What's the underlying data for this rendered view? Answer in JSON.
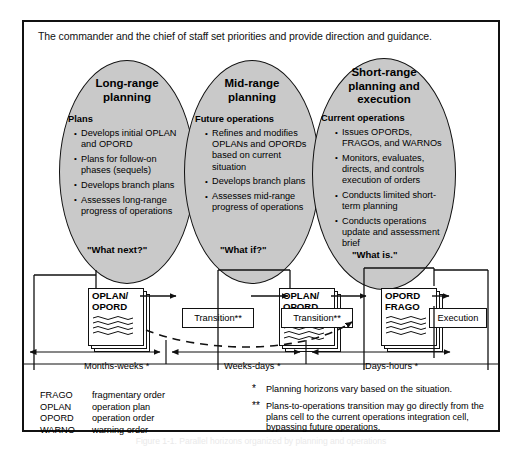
{
  "banner": "The commander and the chief of staff set priorities and provide direction and guidance.",
  "ellipses": [
    {
      "title_line1": "Long-range",
      "title_line2": "planning",
      "subtitle": "Plans",
      "question": "\"What next?\"",
      "items": [
        "Develops initial OPLAN and OPORD",
        "Plans for follow-on phases (sequels)",
        "Develops branch plans",
        "Assesses long-range progress of operations"
      ]
    },
    {
      "title_line1": "Mid-range",
      "title_line2": "planning",
      "subtitle": "Future operations",
      "question": "\"What if?\"",
      "items": [
        "Refines and modifies OPLANs and OPORDs based on current situation",
        "Develops branch plans",
        "Assesses mid-range progress of operations"
      ]
    },
    {
      "title_line1": "Short-range",
      "title_line2": "planning and",
      "title_line3": "execution",
      "subtitle": "Current operations",
      "question": "\"What is.\"",
      "items": [
        "Issues OPORDs, FRAGOs, and WARNOs",
        "Monitors, evaluates, directs, and controls execution of orders",
        "Conducts limited short-term planning",
        "Conducts operations update and assessment brief"
      ]
    }
  ],
  "process": {
    "doc1": {
      "line1": "OPLAN/",
      "line2": "OPORD"
    },
    "doc2": {
      "line1": "OPLAN/",
      "line2": "OPORD",
      "line3": "FRAGO"
    },
    "doc3": {
      "line1": "OPORD",
      "line2": "FRAGO"
    },
    "transition1": "Transition**",
    "transition2": "Transition**",
    "execution": "Execution"
  },
  "timeline": [
    "Months-weeks *",
    "Weeks-days *",
    "Days-hours *"
  ],
  "abbreviations": [
    {
      "key": "FRAGO",
      "value": "fragmentary order"
    },
    {
      "key": "OPLAN",
      "value": "operation plan"
    },
    {
      "key": "OPORD",
      "value": "operation order"
    },
    {
      "key": "WARNO",
      "value": "warning order"
    }
  ],
  "notes": [
    {
      "marker": "*",
      "text": "Planning horizons vary based on the situation."
    },
    {
      "marker": "**",
      "text": "Plans-to-operations transition may go directly from the plans cell to the current operations integration cell, bypassing future operations."
    }
  ],
  "caption": "Figure 1-1. Parallel horizons organized by planning and operations",
  "colors": {
    "ellipse_fill": "#c9c9c9",
    "line": "#111111",
    "background": "#ffffff"
  }
}
